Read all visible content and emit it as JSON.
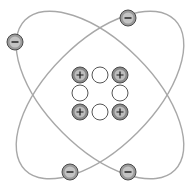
{
  "diagram": {
    "title": "",
    "colors": {
      "background": "#ffffff",
      "orbit_stroke": "#a8a8a8",
      "proton_fill": "#8a8a8a",
      "proton_stroke": "#4a4a4a",
      "neutron_fill": "#ffffff",
      "neutron_stroke": "#555555",
      "electron_fill": "#9a9a9a",
      "electron_stroke": "#4a4a4a",
      "sign_color": "#1a1a1a"
    },
    "protons": [
      {
        "symbol": "+",
        "cx": 80,
        "cy": 75
      },
      {
        "symbol": "+",
        "cx": 120,
        "cy": 75
      },
      {
        "symbol": "+",
        "cx": 80,
        "cy": 112
      },
      {
        "symbol": "+",
        "cx": 120,
        "cy": 112
      }
    ],
    "neutrons": [
      {
        "cx": 100,
        "cy": 75
      },
      {
        "cx": 80,
        "cy": 93
      },
      {
        "cx": 120,
        "cy": 93
      },
      {
        "cx": 100,
        "cy": 112
      }
    ],
    "electrons": [
      {
        "symbol": "−",
        "cx": 15,
        "cy": 42
      },
      {
        "symbol": "−",
        "cx": 128,
        "cy": 18
      },
      {
        "symbol": "−",
        "cx": 70,
        "cy": 172
      },
      {
        "symbol": "−",
        "cx": 128,
        "cy": 172
      }
    ],
    "orbits": [
      {
        "cx": 100,
        "cy": 95,
        "rx": 106,
        "ry": 53,
        "rotate": 45
      },
      {
        "cx": 100,
        "cy": 95,
        "rx": 106,
        "ry": 53,
        "rotate": -45
      }
    ]
  }
}
